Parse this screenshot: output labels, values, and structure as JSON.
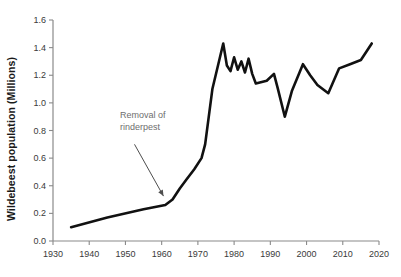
{
  "chart_data": {
    "type": "line",
    "title": "",
    "xlabel": "",
    "ylabel": "Wildebeest population (Millions)",
    "xlim": [
      1930,
      2020
    ],
    "ylim": [
      0.0,
      1.6
    ],
    "grid": false,
    "legend": null,
    "xticks": [
      "1930",
      "1940",
      "1950",
      "1960",
      "1970",
      "1980",
      "1990",
      "2000",
      "2010",
      "2020"
    ],
    "xtick_values": [
      1930,
      1940,
      1950,
      1960,
      1970,
      1980,
      1990,
      2000,
      2010,
      2020
    ],
    "yticks": [
      "0.0",
      "0.2",
      "0.4",
      "0.6",
      "0.8",
      "1.0",
      "1.2",
      "1.4",
      "1.6"
    ],
    "ytick_values": [
      0.0,
      0.2,
      0.4,
      0.6,
      0.8,
      1.0,
      1.2,
      1.4,
      1.6
    ],
    "series": [
      {
        "name": "Wildebeest population",
        "color": "#111111",
        "x": [
          1935,
          1945,
          1955,
          1961,
          1963,
          1965,
          1967,
          1969,
          1971,
          1972,
          1974,
          1977,
          1978,
          1979,
          1980,
          1981,
          1982,
          1983,
          1984,
          1985,
          1986,
          1989,
          1991,
          1992,
          1994,
          1996,
          1999,
          2001,
          2003,
          2006,
          2009,
          2012,
          2015,
          2018
        ],
        "y": [
          0.1,
          0.17,
          0.23,
          0.26,
          0.3,
          0.38,
          0.45,
          0.52,
          0.6,
          0.7,
          1.1,
          1.43,
          1.27,
          1.23,
          1.33,
          1.24,
          1.3,
          1.22,
          1.32,
          1.21,
          1.14,
          1.16,
          1.21,
          1.11,
          0.9,
          1.09,
          1.28,
          1.2,
          1.13,
          1.07,
          1.25,
          1.28,
          1.31,
          1.43
        ]
      }
    ],
    "annotations": [
      {
        "name": "rinderpest-annotation",
        "lines": [
          "Removal of",
          "rinderpest"
        ],
        "color": "#6e6e6e",
        "text_x": 1948.5,
        "text_y": 0.86,
        "arrow_from": [
          1952.5,
          0.7
        ],
        "arrow_to": [
          1960.5,
          0.325
        ]
      }
    ],
    "axis": {
      "color": "#8a8a8a",
      "tick_color": "#8a8a8a"
    }
  }
}
